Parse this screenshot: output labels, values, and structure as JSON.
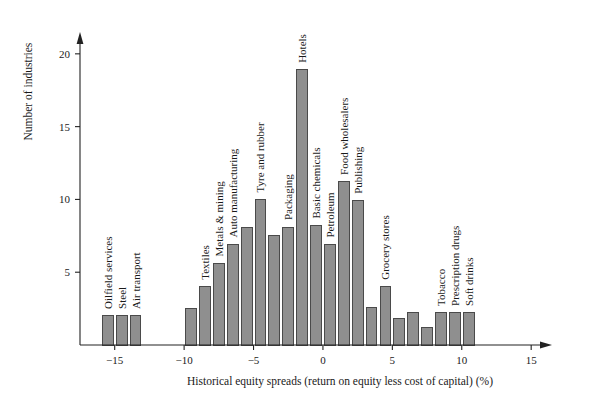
{
  "chart_data": {
    "type": "bar",
    "title": "",
    "subtitle": "",
    "xlabel": "Historical equity spreads (return on equity less cost of capital) (%)",
    "ylabel": "Number of industries",
    "xlim": [
      -17.5,
      16.5
    ],
    "ylim": [
      0,
      21.5
    ],
    "xticks": [
      -15,
      -10,
      -5,
      0,
      5,
      10,
      15
    ],
    "xtick_labels": [
      "−15",
      "−10",
      "−5",
      "0",
      "5",
      "10",
      "15"
    ],
    "yticks": [
      5,
      10,
      15,
      20
    ],
    "ytick_labels": [
      "5",
      "10",
      "15",
      "20"
    ],
    "grid": false,
    "legend": false,
    "bar_width": 0.78,
    "bar_fill": "#8f8f8f",
    "bar_stroke": "#4a4a4a",
    "axis_color": "#222222",
    "background": "#ffffff",
    "x": [
      -15.5,
      -14.5,
      -13.5,
      -9.5,
      -8.5,
      -7.5,
      -6.5,
      -5.5,
      -4.5,
      -3.5,
      -2.5,
      -1.5,
      -0.5,
      0.5,
      1.5,
      2.5,
      3.5,
      4.5,
      5.5,
      6.5,
      7.5,
      8.5,
      9.5,
      10.5
    ],
    "values": [
      2,
      2,
      2,
      2.5,
      4,
      5.6,
      6.9,
      8.1,
      10,
      7.5,
      8.1,
      18.9,
      8.2,
      6.9,
      11.2,
      9.9,
      2.6,
      4,
      1.8,
      2.2,
      1.2,
      2.2,
      2.2,
      2.2
    ],
    "point_labels": [
      "Oilfield services",
      "Steel",
      "Air transport",
      "",
      "Textiles",
      "Metals & mining",
      "Auto manufacturing",
      "",
      "Tyre and rubber",
      "",
      "Packaging",
      "Hotels",
      "Basic chemicals",
      "Petroleum",
      "Food wholesalers",
      "Publishing",
      "",
      "Grocery stores",
      "",
      "",
      "",
      "Tobacco",
      "Prescription drugs",
      "Soft drinks"
    ]
  }
}
